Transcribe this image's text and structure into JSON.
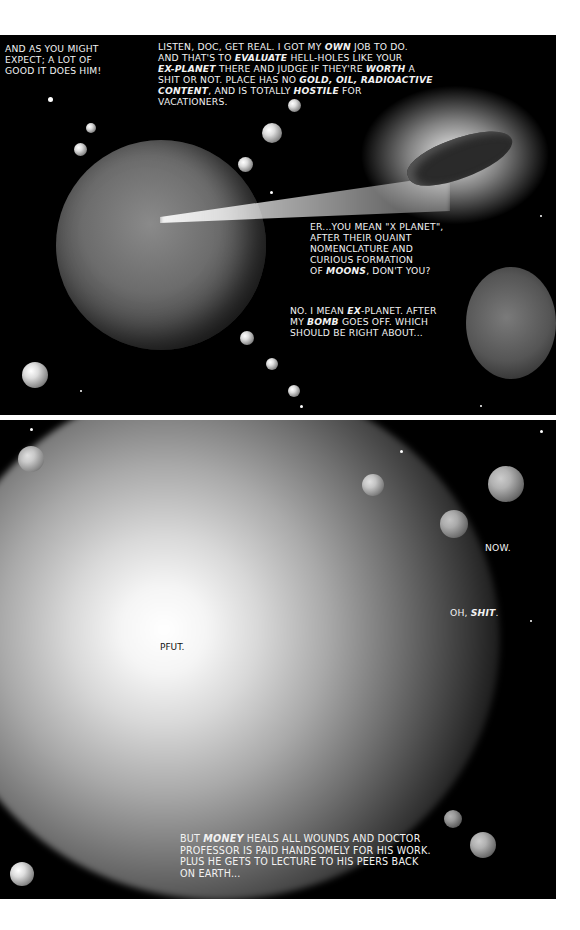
{
  "page": {
    "background": "#ffffff",
    "panel_color": "#000000"
  },
  "panel1": {
    "captions": {
      "top_left": "AND AS YOU MIGHT\nEXPECT; A LOT OF\nGOOD IT DOES HIM!",
      "listen": {
        "l1": "LISTEN, DOC, GET REAL. I GOT MY ",
        "l1_em": "OWN",
        "l1_end": " JOB TO DO.",
        "l2": "AND THAT'S TO ",
        "l2_em": "EVALUATE",
        "l2_end": " HELL-HOLES LIKE YOUR",
        "l3_em": "EX-PLANET",
        "l3": " THERE AND JUDGE IF THEY'RE ",
        "l3_em2": "WORTH",
        "l3_end": " A",
        "l4": "SHIT OR NOT. PLACE HAS NO ",
        "l4_em": "GOLD, OIL, RADIOACTIVE",
        "l5_em": "CONTENT",
        "l5": ", AND IS TOTALLY ",
        "l5_em2": "HOSTILE",
        "l5_end": " FOR",
        "l6": "VACATIONERS."
      },
      "er": {
        "l1": "ER...YOU MEAN \"X PLANET\",",
        "l2": "AFTER THEIR QUAINT",
        "l3": "NOMENCLATURE AND",
        "l4": "CURIOUS FORMATION",
        "l5": "OF ",
        "l5_em": "MOONS",
        "l5_end": ", DON'T YOU?"
      },
      "no": {
        "l1": "NO. I MEAN ",
        "l1_em": "EX",
        "l1_end": "-PLANET. AFTER",
        "l2": "MY ",
        "l2_em": "BOMB",
        "l2_end": " GOES OFF. WHICH",
        "l3": "SHOULD BE RIGHT ABOUT..."
      }
    }
  },
  "panel2": {
    "captions": {
      "now": "NOW.",
      "oh": "OH, ",
      "oh_em": "SHIT",
      "oh_end": ".",
      "sfx": "PFUT.",
      "money": {
        "l1": "BUT ",
        "l1_em": "MONEY",
        "l1_end": " HEALS ALL WOUNDS AND DOCTOR",
        "l2": "PROFESSOR IS PAID HANDSOMELY FOR HIS WORK.",
        "l3": "PLUS HE GETS TO LECTURE TO HIS PEERS BACK",
        "l4": "ON EARTH..."
      }
    }
  }
}
